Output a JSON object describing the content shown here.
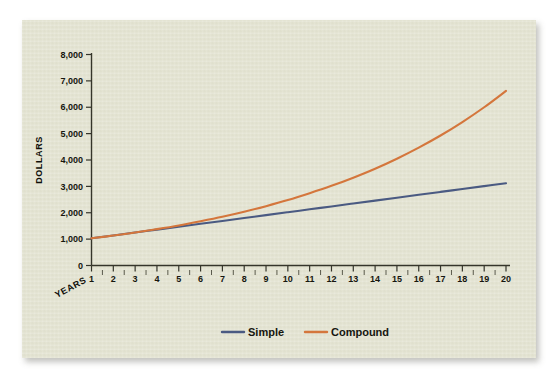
{
  "panel": {
    "background_color": "#e4e4d2"
  },
  "chart_data": {
    "type": "line",
    "title": "",
    "xlabel": "YEARS",
    "ylabel": "DOLLARS",
    "x": [
      1,
      2,
      3,
      4,
      5,
      6,
      7,
      8,
      9,
      10,
      11,
      12,
      13,
      14,
      15,
      16,
      17,
      18,
      19,
      20
    ],
    "xtick_labels": [
      "1",
      "2",
      "3",
      "4",
      "5",
      "6",
      "7",
      "8",
      "9",
      "10",
      "11",
      "12",
      "13",
      "14",
      "15",
      "16",
      "17",
      "18",
      "19",
      "20"
    ],
    "ytick_labels": [
      "0",
      "1,000",
      "2,000",
      "3,000",
      "4,000",
      "5,000",
      "6,000",
      "7,000",
      "8,000"
    ],
    "ytick_values": [
      0,
      1000,
      2000,
      3000,
      4000,
      5000,
      6000,
      7000,
      8000
    ],
    "xlim": [
      1,
      20
    ],
    "ylim": [
      0,
      8000
    ],
    "grid": false,
    "legend_position": "bottom",
    "series": [
      {
        "name": "Simple",
        "color": "#4a5a82",
        "values": [
          1030,
          1140,
          1250,
          1360,
          1470,
          1580,
          1690,
          1800,
          1910,
          2020,
          2130,
          2240,
          2350,
          2460,
          2570,
          2680,
          2790,
          2900,
          3010,
          3120
        ]
      },
      {
        "name": "Compound",
        "color": "#d4763c",
        "values": [
          1030,
          1135,
          1250,
          1380,
          1520,
          1680,
          1850,
          2040,
          2250,
          2480,
          2740,
          3020,
          3330,
          3670,
          4050,
          4470,
          4930,
          5440,
          6000,
          6620
        ]
      }
    ]
  },
  "legend": {
    "items": [
      {
        "label": "Simple",
        "color": "#4a5a82"
      },
      {
        "label": "Compound",
        "color": "#d4763c"
      }
    ]
  }
}
